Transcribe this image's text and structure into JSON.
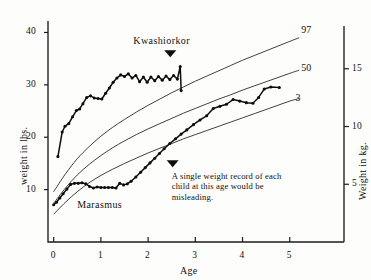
{
  "chart_data": {
    "type": "line",
    "title": "",
    "xlabel": "Age",
    "ylabel": "weight in lbs.",
    "ylabel_right": "Weight in kg.",
    "xlim": [
      -0.12,
      5.45
    ],
    "ylim": [
      0,
      42
    ],
    "ylim_right": [
      0,
      19.05
    ],
    "grid": false,
    "legend_position": "inline-annotations",
    "xticks": [
      0,
      1,
      2,
      3,
      4,
      5
    ],
    "xtick_labels": [
      "0",
      "1",
      "2",
      "3",
      "4",
      "5"
    ],
    "yticks": [
      10,
      20,
      30,
      40
    ],
    "ytick_labels": [
      "10",
      "20",
      "30",
      "40"
    ],
    "yticks_right": [
      5,
      10,
      15
    ],
    "ytick_labels_right": [
      "5",
      "10",
      "15"
    ],
    "annotations": [
      {
        "name": "kwashiorkor-label",
        "text": "Kwashiorkor",
        "x": 2.45,
        "y": 38.2
      },
      {
        "name": "marasmus-label",
        "text": "Marasmus",
        "x": 1.05,
        "y": 7.0
      },
      {
        "name": "misleading-note",
        "text": "A single weight record of each child at this age would be misleading.",
        "lines": [
          "A single weight record of each",
          "child at this age would be",
          "misleading."
        ],
        "x": 2.6,
        "y": 10.4
      }
    ],
    "series": [
      {
        "name": "97th percentile",
        "label": "97",
        "style": "smooth-reference",
        "label_x": 5.2,
        "label_y": 40.2,
        "points": [
          [
            0.0,
            9.6
          ],
          [
            0.25,
            13.0
          ],
          [
            0.5,
            15.9
          ],
          [
            0.75,
            18.2
          ],
          [
            1.0,
            20.2
          ],
          [
            1.25,
            21.9
          ],
          [
            1.5,
            23.4
          ],
          [
            1.75,
            24.8
          ],
          [
            2.0,
            26.1
          ],
          [
            2.25,
            27.3
          ],
          [
            2.5,
            28.5
          ],
          [
            2.75,
            29.6
          ],
          [
            3.0,
            30.7
          ],
          [
            3.25,
            31.7
          ],
          [
            3.5,
            32.7
          ],
          [
            3.75,
            33.7
          ],
          [
            4.0,
            34.7
          ],
          [
            4.25,
            35.6
          ],
          [
            4.5,
            36.5
          ],
          [
            4.75,
            37.4
          ],
          [
            5.0,
            38.3
          ],
          [
            5.2,
            39.0
          ]
        ]
      },
      {
        "name": "50th percentile",
        "label": "50",
        "style": "smooth-reference",
        "label_x": 5.2,
        "label_y": 33.0,
        "points": [
          [
            0.0,
            7.4
          ],
          [
            0.25,
            10.3
          ],
          [
            0.5,
            12.8
          ],
          [
            0.75,
            14.8
          ],
          [
            1.0,
            16.5
          ],
          [
            1.25,
            18.0
          ],
          [
            1.5,
            19.3
          ],
          [
            1.75,
            20.5
          ],
          [
            2.0,
            21.6
          ],
          [
            2.25,
            22.6
          ],
          [
            2.5,
            23.6
          ],
          [
            2.75,
            24.6
          ],
          [
            3.0,
            25.5
          ],
          [
            3.25,
            26.4
          ],
          [
            3.5,
            27.3
          ],
          [
            3.75,
            28.1
          ],
          [
            4.0,
            29.0
          ],
          [
            4.25,
            29.8
          ],
          [
            4.5,
            30.6
          ],
          [
            4.75,
            31.4
          ],
          [
            5.0,
            32.2
          ],
          [
            5.2,
            32.8
          ]
        ]
      },
      {
        "name": "3rd percentile",
        "label": "3",
        "style": "smooth-reference",
        "label_x": 5.08,
        "label_y": 27.3,
        "points": [
          [
            0.0,
            5.3
          ],
          [
            0.25,
            7.6
          ],
          [
            0.5,
            9.6
          ],
          [
            0.75,
            11.3
          ],
          [
            1.0,
            12.7
          ],
          [
            1.25,
            13.9
          ],
          [
            1.5,
            15.0
          ],
          [
            1.75,
            16.0
          ],
          [
            2.0,
            17.0
          ],
          [
            2.25,
            17.9
          ],
          [
            2.5,
            18.8
          ],
          [
            2.75,
            19.7
          ],
          [
            3.0,
            20.5
          ],
          [
            3.25,
            21.3
          ],
          [
            3.5,
            22.1
          ],
          [
            3.75,
            22.9
          ],
          [
            4.0,
            23.7
          ],
          [
            4.25,
            24.5
          ],
          [
            4.5,
            25.3
          ],
          [
            4.75,
            26.1
          ],
          [
            5.0,
            26.9
          ],
          [
            5.2,
            27.4
          ]
        ]
      },
      {
        "name": "Kwashiorkor child weight record",
        "label": "Kwashiorkor",
        "style": "marked-record",
        "points": [
          [
            0.09,
            16.3
          ],
          [
            0.18,
            21.0
          ],
          [
            0.24,
            22.1
          ],
          [
            0.32,
            22.6
          ],
          [
            0.4,
            23.9
          ],
          [
            0.48,
            25.1
          ],
          [
            0.55,
            25.4
          ],
          [
            0.62,
            26.4
          ],
          [
            0.7,
            27.6
          ],
          [
            0.78,
            27.9
          ],
          [
            0.86,
            27.5
          ],
          [
            0.94,
            27.4
          ],
          [
            1.02,
            27.3
          ],
          [
            1.1,
            28.4
          ],
          [
            1.18,
            29.4
          ],
          [
            1.26,
            30.5
          ],
          [
            1.34,
            31.3
          ],
          [
            1.42,
            31.9
          ],
          [
            1.5,
            31.6
          ],
          [
            1.58,
            32.1
          ],
          [
            1.66,
            31.3
          ],
          [
            1.74,
            31.8
          ],
          [
            1.82,
            30.6
          ],
          [
            1.9,
            31.5
          ],
          [
            1.98,
            30.5
          ],
          [
            2.06,
            31.5
          ],
          [
            2.14,
            30.8
          ],
          [
            2.22,
            31.6
          ],
          [
            2.3,
            30.9
          ],
          [
            2.38,
            31.7
          ],
          [
            2.46,
            31.0
          ],
          [
            2.54,
            31.8
          ],
          [
            2.62,
            31.1
          ],
          [
            2.68,
            33.5
          ],
          [
            2.7,
            28.9
          ]
        ]
      },
      {
        "name": "Marasmus child weight record",
        "label": "Marasmus",
        "style": "marked-record",
        "points": [
          [
            0.0,
            7.1
          ],
          [
            0.06,
            7.6
          ],
          [
            0.13,
            8.4
          ],
          [
            0.2,
            9.2
          ],
          [
            0.28,
            10.1
          ],
          [
            0.36,
            11.0
          ],
          [
            0.44,
            11.2
          ],
          [
            0.52,
            11.2
          ],
          [
            0.6,
            11.3
          ],
          [
            0.68,
            11.1
          ],
          [
            0.76,
            10.6
          ],
          [
            0.84,
            10.3
          ],
          [
            0.92,
            10.5
          ],
          [
            1.0,
            10.4
          ],
          [
            1.08,
            10.4
          ],
          [
            1.16,
            10.4
          ],
          [
            1.24,
            10.4
          ],
          [
            1.32,
            10.3
          ],
          [
            1.4,
            11.2
          ],
          [
            1.48,
            10.9
          ],
          [
            1.56,
            11.1
          ],
          [
            1.64,
            11.6
          ],
          [
            1.74,
            12.4
          ],
          [
            1.84,
            13.3
          ],
          [
            1.94,
            14.2
          ],
          [
            2.04,
            15.1
          ],
          [
            2.14,
            16.0
          ],
          [
            2.24,
            16.9
          ],
          [
            2.34,
            17.8
          ],
          [
            2.46,
            18.8
          ],
          [
            2.58,
            19.7
          ],
          [
            2.7,
            20.6
          ],
          [
            2.82,
            21.4
          ],
          [
            2.96,
            22.4
          ],
          [
            3.1,
            23.3
          ],
          [
            3.24,
            24.1
          ],
          [
            3.38,
            25.5
          ],
          [
            3.52,
            25.9
          ],
          [
            3.66,
            26.3
          ],
          [
            3.8,
            27.2
          ],
          [
            3.94,
            26.9
          ],
          [
            4.08,
            26.6
          ],
          [
            4.22,
            26.5
          ],
          [
            4.34,
            27.6
          ],
          [
            4.46,
            29.2
          ],
          [
            4.6,
            29.6
          ],
          [
            4.78,
            29.5
          ]
        ]
      }
    ]
  },
  "axes": {
    "x_title": "Age",
    "y_title_left": "weight in lbs.",
    "y_title_right": "Weight in kg."
  }
}
